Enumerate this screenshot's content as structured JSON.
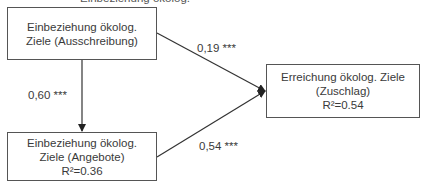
{
  "diagram": {
    "type": "path-model",
    "top_cropped_text": "Einbeziehung ökolog.",
    "nodes": [
      {
        "id": "ausschreibung",
        "lines": [
          "Einbeziehung ökolog.",
          "Ziele (Ausschreibung)"
        ]
      },
      {
        "id": "angebote",
        "lines": [
          "Einbeziehung ökolog.",
          "Ziele (Angebote)",
          "R²=0.36"
        ]
      },
      {
        "id": "zuschlag",
        "lines": [
          "Erreichung ökolog. Ziele",
          "(Zuschlag)",
          "R²=0.54"
        ]
      }
    ],
    "edges": [
      {
        "from": "ausschreibung",
        "to": "angebote",
        "label": "0,60 ***"
      },
      {
        "from": "ausschreibung",
        "to": "zuschlag",
        "label": "0,19 ***"
      },
      {
        "from": "angebote",
        "to": "zuschlag",
        "label": "0,54 ***"
      }
    ],
    "colors": {
      "line": "#333333",
      "border": "#555555",
      "text": "#3a3a3a"
    }
  }
}
